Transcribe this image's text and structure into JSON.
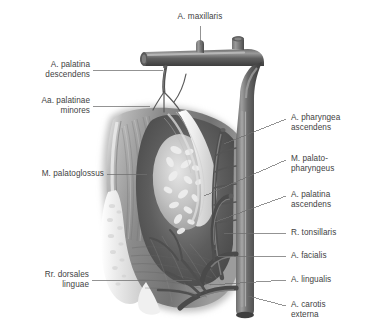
{
  "figure": {
    "style": "grayscale anatomical illustration",
    "colors": {
      "background": "#ffffff",
      "text": "#3f3f3f",
      "leader_line": "#6f6f6f",
      "vessel_dark": "#4d4d4d",
      "vessel_mid": "#6a6a6a",
      "vessel_light": "#9a9a9a",
      "muscle": "#8d8d8d",
      "muscle_dark": "#6c6c6c",
      "tonsil": "#cfcfcf",
      "tonsil_spot": "#ededed",
      "palate_white": "#f2f2f2",
      "tongue_mucosa": "#e4e4e4"
    }
  },
  "labels": {
    "top": [
      {
        "id": "a-maxillaris",
        "text": "A. maxillaris"
      }
    ],
    "left": [
      {
        "id": "a-palatina-descendens",
        "text": "A. palatina\ndescendens"
      },
      {
        "id": "aa-palatinae-minores",
        "text": "Aa. palatinae\nminores"
      },
      {
        "id": "m-palatoglossus",
        "text": "M. palatoglossus"
      },
      {
        "id": "rr-dorsales-linguae",
        "text": "Rr. dorsales\nlinguae"
      }
    ],
    "right": [
      {
        "id": "a-pharyngea-ascendens",
        "text": "A. pharyngea\nascendens"
      },
      {
        "id": "m-palatopharyngeus",
        "text": "M. palato-\npharyngeus"
      },
      {
        "id": "a-palatina-ascendens",
        "text": "A. palatina\nascendens"
      },
      {
        "id": "r-tonsillaris",
        "text": "R. tonsillaris"
      },
      {
        "id": "a-facialis",
        "text": "A. facialis"
      },
      {
        "id": "a-lingualis",
        "text": "A. lingualis"
      },
      {
        "id": "a-carotis-externa",
        "text": "A. carotis\nexterna"
      }
    ]
  }
}
